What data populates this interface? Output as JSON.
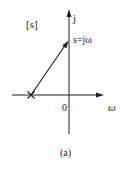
{
  "diagram": {
    "plane_label": "[s]",
    "vertical_axis_label": "j",
    "horizontal_axis_label": "ω",
    "origin_label": "0",
    "point_label": "s=jω",
    "caption": "(a)",
    "pole_marker": "×",
    "colors": {
      "stroke": "#222222",
      "background": "#ffffff"
    }
  }
}
